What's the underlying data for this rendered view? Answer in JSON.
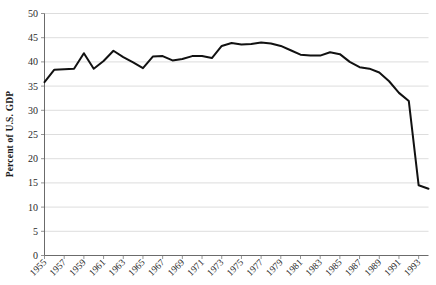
{
  "chart_data": {
    "type": "line",
    "title": "",
    "xlabel": "",
    "ylabel": "Percent of U.S. GDP",
    "ylim": [
      0,
      50
    ],
    "ytick_step": 5,
    "yticks": [
      "0",
      "5",
      "10",
      "15",
      "20",
      "25",
      "30",
      "35",
      "40",
      "45",
      "50"
    ],
    "xlim": [
      1955,
      1994
    ],
    "xticks": [
      "1955",
      "1957",
      "1959",
      "1961",
      "1963",
      "1965",
      "1967",
      "1969",
      "1971",
      "1973",
      "1975",
      "1977",
      "1979",
      "1981",
      "1983",
      "1985",
      "1987",
      "1989",
      "1991",
      "1993"
    ],
    "grid": true,
    "legend": "none",
    "series": [
      {
        "name": "Percent of U.S. GDP",
        "color": "#111111",
        "x": [
          1955,
          1956,
          1957,
          1958,
          1959,
          1960,
          1961,
          1962,
          1963,
          1964,
          1965,
          1966,
          1967,
          1968,
          1969,
          1970,
          1971,
          1972,
          1973,
          1974,
          1975,
          1976,
          1977,
          1978,
          1979,
          1980,
          1981,
          1982,
          1983,
          1984,
          1985,
          1986,
          1987,
          1988,
          1989,
          1990,
          1991,
          1992,
          1993,
          1994
        ],
        "values": [
          35.8,
          38.4,
          38.5,
          38.6,
          41.8,
          38.6,
          40.2,
          42.3,
          41.0,
          39.9,
          38.7,
          41.1,
          41.2,
          40.3,
          40.6,
          41.2,
          41.2,
          40.8,
          43.3,
          43.9,
          43.6,
          43.7,
          44.0,
          43.8,
          43.3,
          42.4,
          41.5,
          41.3,
          41.3,
          42.0,
          41.6,
          40.0,
          38.9,
          38.6,
          37.8,
          36.0,
          33.6,
          31.9,
          14.5,
          13.8
        ]
      }
    ]
  },
  "axis": {
    "y_axis_title": "Percent of U.S. GDP"
  }
}
